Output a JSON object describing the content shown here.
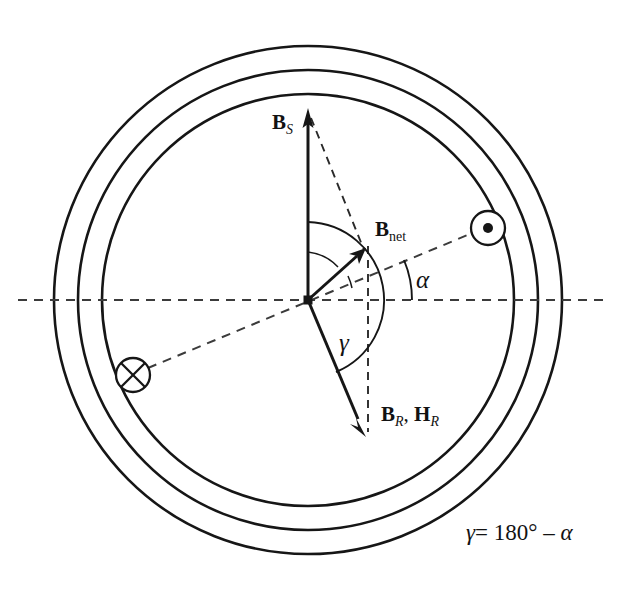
{
  "figure": {
    "name": "synchronous-machine-flux-phasor-diagram",
    "background_color": "#ffffff",
    "line_color": "#161616",
    "dash_color": "#3b3b3b",
    "width": 634,
    "height": 590
  },
  "stator": {
    "center": {
      "x": 308,
      "y": 300
    },
    "circles": [
      {
        "name": "outer-stator-circle",
        "radius": 254
      },
      {
        "name": "middle-stator-circle",
        "radius": 230
      },
      {
        "name": "inner-stator-circle",
        "radius": 206
      }
    ]
  },
  "vectors": [
    {
      "id": "bs",
      "label_html": "<span class=\"bold-sym\">B</span><span class=\"sub\">S</span>",
      "label_text": "B_S",
      "angle_deg": 90,
      "length": 188,
      "label_x": 272,
      "label_y": 112
    },
    {
      "id": "bnet",
      "label_html": "<span class=\"bold-sym\">B</span><span class=\"sub-roman\">net</span>",
      "label_text": "B_net",
      "angle_deg": 52,
      "length": 87,
      "label_x": 375,
      "label_y": 219
    },
    {
      "id": "br_hr",
      "label_html": "<span class=\"bold-sym\">B</span><span class=\"sub\">R</span>, <span class=\"bold-sym\">H</span><span class=\"sub\">R</span>",
      "label_text": "B_R, H_R",
      "angle_deg": -69,
      "length": 139,
      "label_x": 381,
      "label_y": 404
    }
  ],
  "angles": [
    {
      "id": "alpha",
      "symbol": "α",
      "label_x": 416,
      "label_y": 267,
      "description": "angle between rotor-field axis dashed line and horizontal reference axis"
    },
    {
      "id": "gamma",
      "symbol": "γ",
      "label_x": 339,
      "label_y": 330,
      "description": "angle between B_S vertical axis and B_R vector"
    }
  ],
  "conductors": [
    {
      "id": "current-out-of-page",
      "symbol": "dot-in-circle-icon",
      "x": 488,
      "y": 228,
      "radius": 17
    },
    {
      "id": "current-into-page",
      "symbol": "cross-in-circle-icon",
      "x": 133,
      "y": 375,
      "radius": 17
    }
  ],
  "reference_lines": [
    {
      "id": "horizontal-axis",
      "type": "dashed",
      "from_x": 18,
      "to_x": 606,
      "y": 300
    },
    {
      "id": "rotor-axis",
      "type": "dashed",
      "description": "dashed line through the two conductors at angle alpha"
    },
    {
      "id": "bnet-projection",
      "type": "dashed",
      "description": "vertical dashed drop line from B_net tip to B_R tip level"
    },
    {
      "id": "bs-to-bnet",
      "type": "dashed",
      "description": "dashed construction line from B_S tip to B_net tip"
    }
  ],
  "formula": {
    "id": "gamma-relation",
    "gamma": "γ",
    "equals": "=",
    "value": "180°",
    "minus": "–",
    "alpha": "α",
    "full_text": "γ = 180° – α",
    "x": 466,
    "y": 533
  }
}
